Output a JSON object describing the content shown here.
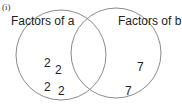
{
  "part_label": "(i)",
  "sets": [
    {
      "name": "Factors of a",
      "elements_only": [
        "2",
        "2",
        "2",
        "2"
      ]
    },
    {
      "name": "Factors of b",
      "elements_only": [
        "7",
        "7"
      ]
    }
  ],
  "intersection": [],
  "colors": {
    "outline": "#888888",
    "text": "#222222"
  }
}
